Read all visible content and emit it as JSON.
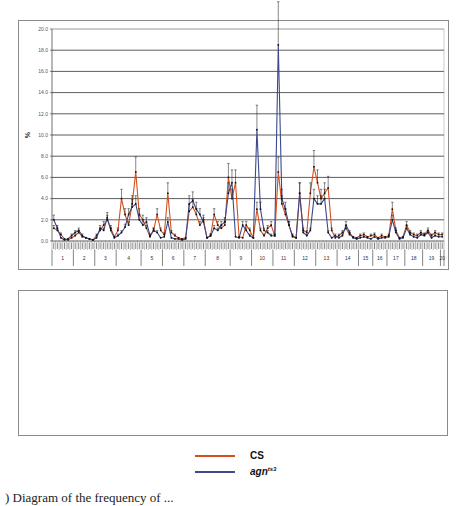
{
  "colors": {
    "cs": "#d4511e",
    "agn": "#3b4a8c",
    "errorbar": "#111111",
    "grid": "#333333"
  },
  "legend": {
    "items": [
      {
        "label": "CS",
        "sup": "",
        "color": "#d4511e"
      },
      {
        "label": "agn",
        "sup": "ts3",
        "color": "#3b4a8c"
      }
    ]
  },
  "caption": ") Diagram of the frequency of ...",
  "chart_data": [
    {
      "type": "line",
      "title": "",
      "ylabel": "%",
      "xlabel": "",
      "ylim": [
        0,
        20
      ],
      "yticks": [
        "0.0",
        "2.0",
        "4.0",
        "6.0",
        "8.0",
        "10.0",
        "12.0",
        "14.0",
        "16.0",
        "18.0",
        "20.0"
      ],
      "grid": true,
      "legend_position": "below",
      "groups": [
        "1",
        "2",
        "3",
        "4",
        "5",
        "6",
        "7",
        "8",
        "9",
        "10",
        "11",
        "12",
        "13",
        "14",
        "15",
        "16",
        "17",
        "18",
        "19",
        "20"
      ],
      "group_sizes": [
        6,
        6,
        6,
        7,
        6,
        6,
        6,
        7,
        6,
        6,
        6,
        6,
        6,
        6,
        4,
        4,
        5,
        5,
        5,
        1
      ],
      "series": [
        {
          "name": "CS",
          "values": [
            1.2,
            1.0,
            0.6,
            0.2,
            0.1,
            0.3,
            0.5,
            0.8,
            0.4,
            0.3,
            0.2,
            0.1,
            0.5,
            1.0,
            1.5,
            2.0,
            1.2,
            0.4,
            1.0,
            4.0,
            2.5,
            1.5,
            3.5,
            6.5,
            2.5,
            2.0,
            1.2,
            0.4,
            1.0,
            2.5,
            1.0,
            0.6,
            4.5,
            0.8,
            0.5,
            0.3,
            0.2,
            0.3,
            2.8,
            3.2,
            2.5,
            1.5,
            2.0,
            0.3,
            0.5,
            2.5,
            1.5,
            1.2,
            1.5,
            6.0,
            4.0,
            5.5,
            0.4,
            0.3,
            1.5,
            1.0,
            0.3,
            3.0,
            1.0,
            0.5,
            1.2,
            1.5,
            0.5,
            6.5,
            3.5,
            2.5,
            1.5,
            0.5,
            0.3,
            4.5,
            1.0,
            0.8,
            4.5,
            7.0,
            5.5,
            4.0,
            4.5,
            5.0,
            1.0,
            0.3,
            0.5,
            0.8,
            1.2,
            0.6,
            0.4,
            0.3,
            0.5,
            0.6,
            0.4,
            0.5,
            0.6,
            0.3,
            0.5,
            0.4,
            0.5,
            3.0,
            1.0,
            0.3,
            0.4,
            1.5,
            0.8,
            0.6,
            0.5,
            0.8,
            0.6,
            1.0,
            0.5,
            0.8,
            0.6,
            0.6
          ]
        },
        {
          "name": "agn ts3",
          "values": [
            2.0,
            1.2,
            0.3,
            0.1,
            0.2,
            0.5,
            0.8,
            1.0,
            0.5,
            0.3,
            0.2,
            0.1,
            0.3,
            1.2,
            1.0,
            2.2,
            1.0,
            0.3,
            0.5,
            0.8,
            1.3,
            2.5,
            3.2,
            3.5,
            2.0,
            1.5,
            1.8,
            0.5,
            1.0,
            0.8,
            0.3,
            0.4,
            1.8,
            0.3,
            0.2,
            0.2,
            0.1,
            0.2,
            3.5,
            3.8,
            3.0,
            2.5,
            1.8,
            0.3,
            0.5,
            1.2,
            1.0,
            1.5,
            1.8,
            4.5,
            5.5,
            0.4,
            0.3,
            1.5,
            1.0,
            0.5,
            0.3,
            10.5,
            3.0,
            1.0,
            0.8,
            0.5,
            0.5,
            18.5,
            4.0,
            3.0,
            1.5,
            0.4,
            0.3,
            4.5,
            0.8,
            0.5,
            1.0,
            4.0,
            3.5,
            3.5,
            4.0,
            0.8,
            0.3,
            0.5,
            0.3,
            0.5,
            1.5,
            0.8,
            0.3,
            0.2,
            0.3,
            0.4,
            0.3,
            0.2,
            0.4,
            0.2,
            0.3,
            0.3,
            0.4,
            2.0,
            0.8,
            0.2,
            0.3,
            1.2,
            0.6,
            0.4,
            0.3,
            0.6,
            0.5,
            0.8,
            0.3,
            0.5,
            0.4,
            0.4
          ]
        }
      ]
    },
    {
      "type": "line",
      "title": "",
      "ylabel": "%",
      "xlabel": "",
      "ylim": [
        0,
        70
      ],
      "yticks": [
        "0.0",
        "10.0",
        "20.0",
        "30.0",
        "40.0",
        "50.0",
        "60.0",
        "70.0"
      ],
      "grid": true,
      "legend_position": "below",
      "categories": [
        "E",
        "F",
        "A",
        "B",
        "C",
        "D",
        "E",
        "F",
        "A",
        "B",
        "C",
        "D",
        "E",
        "F",
        "A",
        "B",
        "C",
        "D",
        "E",
        "F",
        "A",
        "B",
        "C",
        "D",
        "E",
        "F",
        "A",
        "B",
        "C",
        "D",
        "E",
        "F",
        "A",
        "B",
        "C",
        "D",
        "E",
        "F",
        "A",
        "B",
        "C",
        "D",
        "E",
        "F",
        "A",
        "B",
        "C",
        "D",
        "E",
        "F",
        "A"
      ],
      "groups": [
        "31",
        "32",
        "33",
        "34",
        "35",
        "36",
        "37",
        "38",
        "39",
        "40"
      ],
      "group_sizes": [
        2,
        6,
        6,
        6,
        6,
        6,
        6,
        6,
        6,
        1
      ],
      "series": [
        {
          "name": "CS",
          "values": [
            0.5,
            0.3,
            0.1,
            0.2,
            0.3,
            0.3,
            0.1,
            0.1,
            10.0,
            5.5,
            3.0,
            3.0,
            0.5,
            0.2,
            7.0,
            2.0,
            1.5,
            0.8,
            0.3,
            0.3,
            0.5,
            6.0,
            23.0,
            27.0,
            25.0,
            40.0,
            20.0,
            21.0,
            40.0,
            10.0,
            0.1,
            0.1,
            0.8,
            0.2,
            0.2,
            0.3,
            0.1,
            0.1,
            0.5,
            0.5,
            0.5,
            0.5,
            3.0,
            0.3,
            0.1,
            0.1,
            0.2,
            1.5,
            0.5,
            0.3,
            3.0
          ]
        },
        {
          "name": "agn ts3",
          "values": [
            0.3,
            0.2,
            0.1,
            0.1,
            0.2,
            0.2,
            0.1,
            0.1,
            20.0,
            2.0,
            0.5,
            0.5,
            0.2,
            0.1,
            8.0,
            2.0,
            1.0,
            0.5,
            0.2,
            0.2,
            0.5,
            18.0,
            19.0,
            20.0,
            17.0,
            42.0,
            18.0,
            17.0,
            62.0,
            12.0,
            0.1,
            0.1,
            1.0,
            0.2,
            0.1,
            0.3,
            0.1,
            0.1,
            0.8,
            0.6,
            0.7,
            0.8,
            1.5,
            0.2,
            0.1,
            0.1,
            0.2,
            2.5,
            0.4,
            0.3,
            2.5
          ]
        }
      ]
    }
  ]
}
